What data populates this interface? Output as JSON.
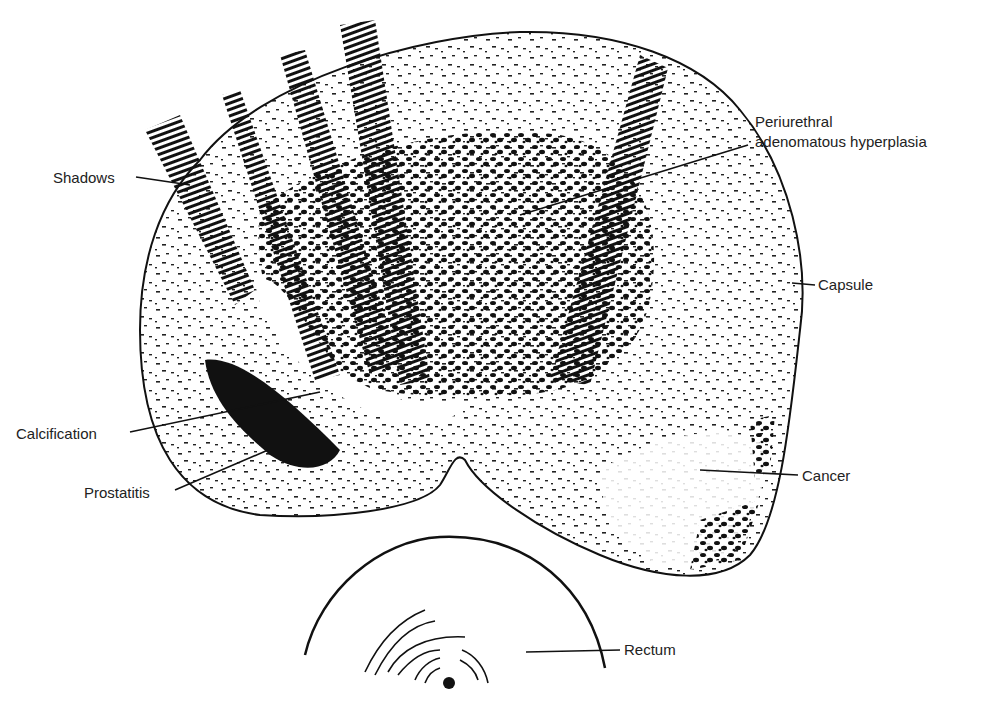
{
  "diagram": {
    "type": "anatomical illustration (transrectal ultrasound of prostate)",
    "labels": {
      "shadows": "Shadows",
      "periurethral_line1": "Periurethral",
      "periurethral_line2": "adenomatous hyperplasia",
      "capsule": "Capsule",
      "calcification": "Calcification",
      "prostatitis": "Prostatitis",
      "cancer": "Cancer",
      "rectum": "Rectum"
    },
    "colors": {
      "ink": "#111111",
      "background": "#ffffff"
    }
  }
}
